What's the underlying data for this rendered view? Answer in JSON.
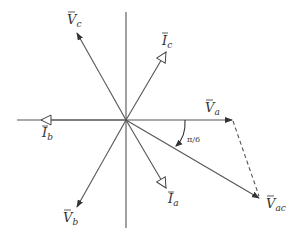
{
  "diagram": {
    "type": "phasor-diagram",
    "origin": [
      126,
      120
    ],
    "colors": {
      "line": "#555555",
      "text": "#333333",
      "background": "#ffffff"
    },
    "axes": {
      "horizontal": [
        17,
        120,
        232,
        120
      ],
      "vertical": [
        126,
        12,
        126,
        228
      ]
    },
    "voltage_phasors": [
      {
        "id": "Va",
        "base": "V",
        "sub": "a",
        "tip": [
          232,
          120
        ]
      },
      {
        "id": "Vb",
        "base": "V",
        "sub": "b",
        "tip": [
          77,
          207
        ]
      },
      {
        "id": "Vc",
        "base": "V",
        "sub": "c",
        "tip": [
          77,
          33
        ]
      },
      {
        "id": "Vac",
        "base": "V",
        "sub": "ac",
        "tip": [
          259,
          198
        ]
      }
    ],
    "current_phasors": [
      {
        "id": "Ia",
        "base": "I",
        "sub": "a",
        "tip": [
          166,
          188
        ]
      },
      {
        "id": "Ib",
        "base": "I",
        "sub": "b",
        "tip": [
          41,
          120
        ]
      },
      {
        "id": "Ic",
        "base": "I",
        "sub": "c",
        "tip": [
          166,
          52
        ]
      }
    ],
    "dashed_segment": {
      "from": "Va",
      "to": "Vac"
    },
    "angle": {
      "label": "π/6",
      "between": [
        "Va",
        "Vac"
      ]
    }
  },
  "labels": {
    "va": {
      "base": "V",
      "sub": "a"
    },
    "vb": {
      "base": "V",
      "sub": "b"
    },
    "vc": {
      "base": "V",
      "sub": "c"
    },
    "vac": {
      "base": "V",
      "sub": "ac"
    },
    "ia": {
      "base": "I",
      "sub": "a"
    },
    "ib": {
      "base": "I",
      "sub": "b"
    },
    "ic": {
      "base": "I",
      "sub": "c"
    },
    "angle": "π/6"
  }
}
